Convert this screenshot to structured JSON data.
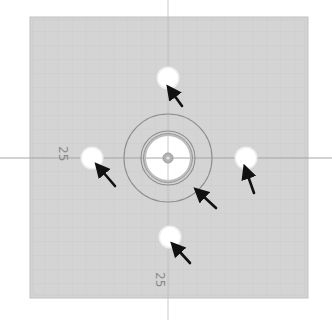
{
  "caption": {
    "text": ""
  },
  "drawing": {
    "title": "Plate with center hub and four mounting holes",
    "colors": {
      "background": "#ffffff",
      "plate_fill": "#d4d4d4",
      "plate_edge": "#c2c2c2",
      "grid_line": "#c6c6c6",
      "axis_line": "#a6a6a6",
      "ring_stroke": "#8e8e8e",
      "hole_fill": "#ffffff",
      "hole_halo": "#eeeeee",
      "hub_core": "#b4b4b4",
      "arrow": "#111111",
      "label": "#8a8a8a"
    },
    "plate": {
      "x": 30,
      "y": 17,
      "width": 278,
      "height": 281
    },
    "center": {
      "x": 168,
      "y": 158
    },
    "outer_ring": {
      "r": 44
    },
    "inner_ring": {
      "r": 27
    },
    "bore": {
      "r": 22
    },
    "hub_core": {
      "r": 5
    },
    "holes": [
      {
        "name": "top",
        "cx": 168,
        "cy": 78,
        "r": 10
      },
      {
        "name": "left",
        "cx": 92,
        "cy": 158,
        "r": 10
      },
      {
        "name": "right",
        "cx": 246,
        "cy": 158,
        "r": 10
      },
      {
        "name": "bottom",
        "cx": 170,
        "cy": 237,
        "r": 10
      }
    ],
    "arrows": [
      {
        "target": "top-hole",
        "tip": [
          172,
          92
        ],
        "tail": [
          182,
          106
        ]
      },
      {
        "target": "left-hole",
        "tip": [
          101,
          169
        ],
        "tail": [
          115,
          186
        ]
      },
      {
        "target": "right-hole",
        "tip": [
          247,
          172
        ],
        "tail": [
          254,
          193
        ]
      },
      {
        "target": "bottom-hole",
        "tip": [
          177,
          248
        ],
        "tail": [
          190,
          263
        ]
      },
      {
        "target": "outer-ring",
        "tip": [
          201,
          193
        ],
        "tail": [
          216,
          208
        ]
      }
    ],
    "dimension_labels": [
      {
        "name": "left-dimension",
        "text": "25",
        "x": 63,
        "y": 152,
        "rotate": 90
      },
      {
        "name": "bottom-dimension",
        "text": "25",
        "x": 160,
        "y": 278,
        "rotate": 90
      }
    ]
  }
}
